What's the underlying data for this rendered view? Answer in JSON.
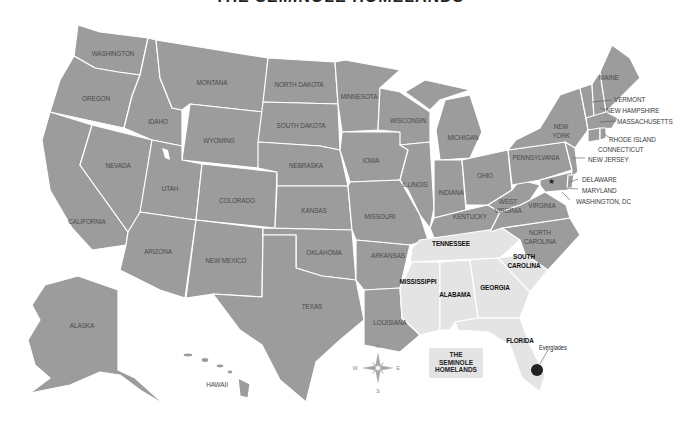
{
  "title": "THE SEMINOLE HOMELANDS",
  "colors": {
    "state_fill": "#9c9c9c",
    "homeland_fill": "#e4e4e4",
    "border": "#ffffff",
    "label": "#4a4a4a",
    "homeland_label": "#111111",
    "marker": "#222222"
  },
  "legend": {
    "line1": "THE",
    "line2": "SEMINOLE",
    "line3": "HOMELANDS"
  },
  "marker": {
    "label": "Everglades",
    "icon": "location-dot-icon"
  },
  "compass": {
    "n": "N",
    "s": "S",
    "e": "E",
    "w": "W",
    "icon": "compass-rose-icon"
  },
  "states": {
    "washington": "WASHINGTON",
    "oregon": "OREGON",
    "california": "CALIFORNIA",
    "nevada": "NEVADA",
    "idaho": "IDAHO",
    "montana": "MONTANA",
    "wyoming": "WYOMING",
    "utah": "UTAH",
    "arizona": "ARIZONA",
    "colorado": "COLORADO",
    "new_mexico": "NEW MEXICO",
    "north_dakota": "NORTH DAKOTA",
    "south_dakota": "SOUTH DAKOTA",
    "nebraska": "NEBRASKA",
    "kansas": "KANSAS",
    "oklahoma": "OKLAHOMA",
    "texas": "TEXAS",
    "minnesota": "MINNESOTA",
    "iowa": "IOWA",
    "missouri": "MISSOURI",
    "arkansas": "ARKANSAS",
    "louisiana": "LOUISIANA",
    "wisconsin": "WISCONSIN",
    "illinois": "ILLINOIS",
    "michigan": "MICHIGAN",
    "indiana": "INDIANA",
    "ohio": "OHIO",
    "kentucky": "KENTUCKY",
    "tennessee": "TENNESSEE",
    "mississippi": "MISSISSIPPI",
    "alabama": "ALABAMA",
    "georgia": "GEORGIA",
    "florida": "FLORIDA",
    "south_carolina_1": "SOUTH",
    "south_carolina_2": "CAROLINA",
    "north_carolina_1": "NORTH",
    "north_carolina_2": "CAROLINA",
    "virginia": "VIRGINIA",
    "west_virginia_1": "WEST",
    "west_virginia_2": "VIRGINIA",
    "pennsylvania": "PENNSYLVANIA",
    "new_york_1": "NEW",
    "new_york_2": "YORK",
    "maine": "MAINE",
    "vermont": "VERMONT",
    "new_hampshire": "NEW HAMPSHIRE",
    "massachusetts": "MASSACHUSETTS",
    "rhode_island": "RHODE ISLAND",
    "connecticut": "CONNECTICUT",
    "new_jersey": "NEW JERSEY",
    "delaware": "DELAWARE",
    "maryland": "MARYLAND",
    "washington_dc": "WASHINGTON, DC",
    "alaska": "ALASKA",
    "hawaii": "HAWAII"
  }
}
